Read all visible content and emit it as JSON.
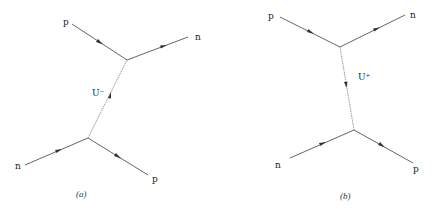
{
  "diagrams": [
    {
      "id": "a",
      "caption": "(a)",
      "boson_label": "U⁻",
      "particles": {
        "top_in": "p",
        "top_out": "n",
        "bottom_in": "n",
        "bottom_out": "p"
      }
    },
    {
      "id": "b",
      "caption": "(b)",
      "boson_label": "U⁺",
      "particles": {
        "top_in": "p",
        "top_out": "n",
        "bottom_in": "n",
        "bottom_out": "p"
      }
    }
  ],
  "colors": {
    "fermion_line": "#666666",
    "boson_line": "#9a9a9a",
    "arrow": "#333333",
    "text": "#222222"
  }
}
